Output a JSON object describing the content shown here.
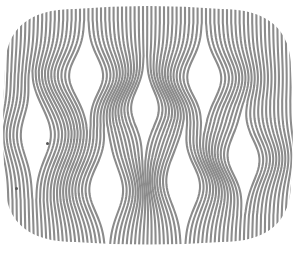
{
  "artwork": {
    "description": "Op-art illustration: rounded TV-screen shaped field of vertical gray stripes that bend around lens-shaped white openings",
    "width": 297,
    "height": 253,
    "background": "#ffffff",
    "stripe_color": "#8c8c8c",
    "stripe_period": 4.2,
    "stripe_width": 2.1,
    "outline": {
      "left": 5,
      "right": 291,
      "top": 9,
      "bottom": 242,
      "corner_rx": 70,
      "corner_ry": 60
    },
    "openings": [
      {
        "id": "A",
        "cx": 85,
        "cy": 76,
        "rx": 15,
        "ry": 34
      },
      {
        "id": "B",
        "cx": 146,
        "cy": 108,
        "rx": 12,
        "ry": 32
      },
      {
        "id": "C",
        "cx": 205,
        "cy": 78,
        "rx": 15,
        "ry": 34
      },
      {
        "id": "D",
        "cx": 37,
        "cy": 135,
        "rx": 13,
        "ry": 40
      },
      {
        "id": "E",
        "cx": 107,
        "cy": 190,
        "rx": 15,
        "ry": 40
      },
      {
        "id": "F",
        "cx": 184,
        "cy": 184,
        "rx": 15,
        "ry": 40
      },
      {
        "id": "G",
        "cx": 243,
        "cy": 158,
        "rx": 14,
        "ry": 35
      }
    ],
    "marks": [
      {
        "x": 47,
        "y": 143
      },
      {
        "x": 16,
        "y": 188
      }
    ]
  }
}
